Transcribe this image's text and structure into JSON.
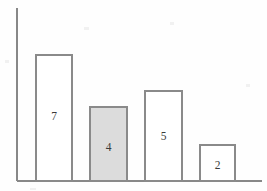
{
  "chart_data": {
    "type": "bar",
    "title": "",
    "subtitle": "",
    "xlabel": "",
    "ylabel": "",
    "categories": [
      "",
      "",
      "",
      ""
    ],
    "values": [
      7,
      4,
      5,
      2
    ],
    "data_labels": [
      "7",
      "4",
      "5",
      "2"
    ],
    "series": [
      {
        "name": "",
        "values": [
          7,
          4,
          5,
          2
        ]
      }
    ],
    "ylim": [
      0,
      9.6
    ],
    "xlim": [
      0,
      4
    ],
    "grid": false,
    "legend": false,
    "legend_position": "none",
    "tick_labels_x": [],
    "tick_labels_y": [],
    "annotations": [],
    "bars": [
      {
        "index": 0,
        "label": "7",
        "value": 7,
        "fill": "#ffffff",
        "stroke": "#8a8a8a",
        "highlighted": false,
        "x": 36,
        "width": 36,
        "top": 55,
        "bottom": 181,
        "label_x": 54,
        "label_y": 117
      },
      {
        "index": 1,
        "label": "4",
        "value": 4,
        "fill": "#dcdcdc",
        "stroke": "#8a8a8a",
        "highlighted": true,
        "x": 90,
        "width": 37,
        "top": 107,
        "bottom": 181,
        "label_x": 108.5,
        "label_y": 148
      },
      {
        "index": 2,
        "label": "5",
        "value": 5,
        "fill": "#ffffff",
        "stroke": "#8a8a8a",
        "highlighted": false,
        "x": 145,
        "width": 37,
        "top": 91,
        "bottom": 181,
        "label_x": 163.5,
        "label_y": 137
      },
      {
        "index": 3,
        "label": "2",
        "value": 2,
        "fill": "#ffffff",
        "stroke": "#8a8a8a",
        "highlighted": false,
        "x": 200,
        "width": 35,
        "top": 145,
        "bottom": 181,
        "label_x": 217.5,
        "label_y": 166
      }
    ],
    "axes": {
      "y_axis": {
        "x": 17,
        "y_top": 8,
        "y_bottom": 181
      },
      "x_axis": {
        "y": 181,
        "x_left": 17,
        "x_right": 262
      },
      "color": "#888888"
    },
    "colors": {
      "background": "#fefefe",
      "axis": "#888888",
      "bar_stroke": "#8a8a8a",
      "bar_fill_default": "#ffffff",
      "bar_fill_highlight": "#dcdcdc",
      "label_text": "#3a3a3a"
    }
  }
}
